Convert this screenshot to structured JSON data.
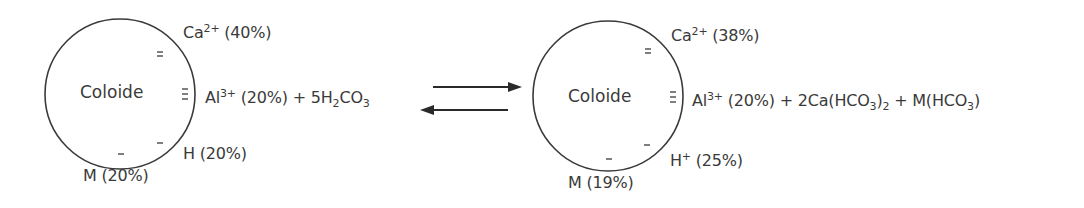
{
  "diagram": {
    "arrow": "equilibrium",
    "left": {
      "core_label": "Coloide",
      "ca": {
        "ion": "Ca",
        "charge": "2+",
        "pct": "(40%)"
      },
      "al": {
        "ion": "Al",
        "charge": "3+",
        "pct": "(20%)"
      },
      "plus": "+",
      "reagent": {
        "coef": "5",
        "pre": "H",
        "sub1": "2",
        "mid": "CO",
        "sub2": "3"
      },
      "h": {
        "ion": "H",
        "pct": "(20%)"
      },
      "m": {
        "ion": "M",
        "pct": "(20%)"
      }
    },
    "right": {
      "core_label": "Coloide",
      "ca": {
        "ion": "Ca",
        "charge": "2+",
        "pct": "(38%)"
      },
      "al": {
        "ion": "Al",
        "charge": "3+",
        "pct": "(20%)"
      },
      "plus1": "+",
      "product1": {
        "text": "2Ca(HCO",
        "sub1": "3",
        "close": ")",
        "sub2": "2"
      },
      "plus2": "+",
      "product2": {
        "text": "M(HCO",
        "sub1": "3",
        "close": ")"
      },
      "h": {
        "ion": "H",
        "charge": "+",
        "pct": "(25%)"
      },
      "m": {
        "ion": "M",
        "pct": "(19%)"
      }
    }
  }
}
